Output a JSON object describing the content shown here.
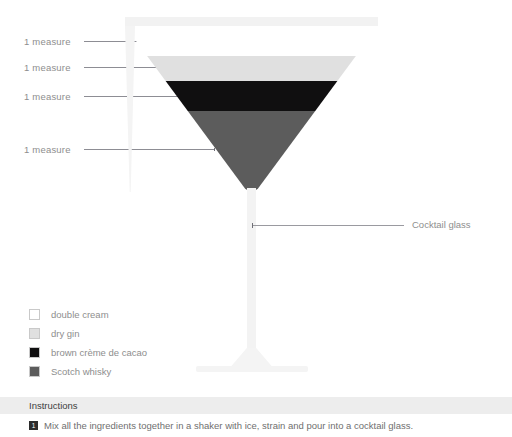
{
  "diagram": {
    "measure_callouts": [
      {
        "label": "1 measure",
        "layer": "double cream"
      },
      {
        "label": "1 measure",
        "layer": "dry gin"
      },
      {
        "label": "1 measure",
        "layer": "brown crème de cacao"
      },
      {
        "label": "1 measure",
        "layer": "Scotch whisky"
      }
    ],
    "glass_callout": {
      "label": "Cocktail glass"
    },
    "glass": {
      "rim_color": "#f2f2f2",
      "wall_color": "#f4f4f4",
      "stem_color": "#f3f3f3"
    },
    "layers": [
      {
        "name": "double cream",
        "color": "#ffffff"
      },
      {
        "name": "dry gin",
        "color": "#e0e0e0"
      },
      {
        "name": "brown crème de cacao",
        "color": "#100f10"
      },
      {
        "name": "Scotch whisky",
        "color": "#5c5c5c"
      }
    ]
  },
  "legend": {
    "items": [
      {
        "label": "double cream",
        "color": "#ffffff"
      },
      {
        "label": "dry gin",
        "color": "#e0e0e0"
      },
      {
        "label": "brown crème de cacao",
        "color": "#100f10"
      },
      {
        "label": "Scotch whisky",
        "color": "#5c5c5c"
      }
    ]
  },
  "instructions": {
    "heading": "Instructions",
    "steps": [
      {
        "number": "1",
        "text": "Mix all the ingredients together in a shaker with ice, strain and pour into a cocktail glass."
      }
    ]
  }
}
